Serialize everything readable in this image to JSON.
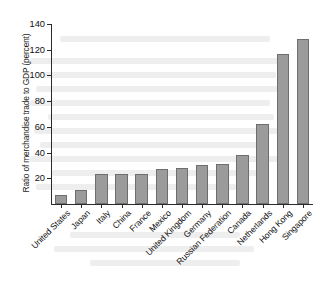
{
  "chart_data": {
    "type": "bar",
    "title": "",
    "xlabel": "",
    "ylabel": "Ratio of merchandise trade to GDP (percent)",
    "ylim": [
      0,
      140
    ],
    "yticks": [
      0,
      20,
      40,
      60,
      80,
      100,
      120,
      140
    ],
    "ytick_labels": [
      "0",
      "20",
      "40",
      "60",
      "80",
      "100",
      "120",
      "140"
    ],
    "grid": false,
    "legend": null,
    "bar_color": "#9b9b9b",
    "bar_edge_color": "#6e6e6e",
    "axis_color": "#2b2b2b",
    "categories": [
      "United States",
      "Japan",
      "Italy",
      "China",
      "France",
      "Mexico",
      "United Kingdom",
      "Germany",
      "Russian Federation",
      "Canada",
      "Netherlands",
      "Hong Kong",
      "Singapore"
    ],
    "values": [
      7,
      11,
      23,
      23,
      23,
      27,
      28,
      30,
      31,
      38,
      62,
      117,
      128
    ]
  }
}
